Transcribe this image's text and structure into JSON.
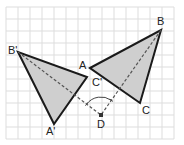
{
  "diagram": {
    "grid": {
      "x0": 6,
      "y0": 7,
      "x1": 174,
      "y1": 139,
      "step": 12,
      "color": "#dddddd"
    },
    "colors": {
      "fill": "#cfcfcf",
      "stroke": "#1a1a1a",
      "dashed": "#555555"
    },
    "points": {
      "A": {
        "label": "A",
        "x": 90,
        "y": 68,
        "lx": 79,
        "ly": 69
      },
      "B": {
        "label": "B",
        "x": 161,
        "y": 30,
        "lx": 157,
        "ly": 25
      },
      "C": {
        "label": "C",
        "x": 140,
        "y": 103,
        "lx": 142,
        "ly": 114
      },
      "A'": {
        "label": "A'",
        "x": 54,
        "y": 124,
        "lx": 46,
        "ly": 135
      },
      "B'": {
        "label": "B'",
        "x": 18,
        "y": 52,
        "lx": 8,
        "ly": 54
      },
      "C'": {
        "label": "C'",
        "x": 87,
        "y": 77,
        "lx": 92,
        "ly": 86
      },
      "D": {
        "label": "D",
        "x": 101,
        "y": 115,
        "lx": 97,
        "ly": 128
      }
    },
    "triangles": [
      {
        "name": "ABC",
        "vertices": [
          "A",
          "B",
          "C"
        ]
      },
      {
        "name": "A'B'C'",
        "vertices": [
          "A'",
          "B'",
          "C'"
        ]
      }
    ],
    "dashed_segments": [
      {
        "from": "B'",
        "to": "D"
      },
      {
        "from": "B",
        "to": "D"
      }
    ],
    "angle_arc": {
      "center": "D",
      "radius": 18,
      "from": "B'",
      "to": "B"
    }
  }
}
